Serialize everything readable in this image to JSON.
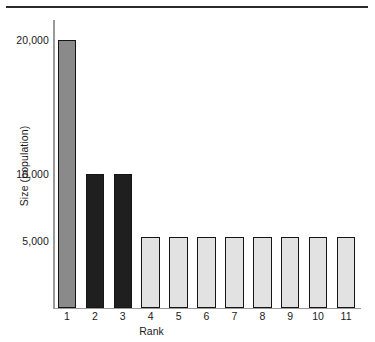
{
  "chart_data": {
    "type": "bar",
    "title": "",
    "subtitle": "",
    "xlabel": "Rank",
    "ylabel": "Size (population)",
    "categories": [
      "1",
      "2",
      "3",
      "4",
      "5",
      "6",
      "7",
      "8",
      "9",
      "10",
      "11"
    ],
    "values": [
      20000,
      10000,
      10000,
      5300,
      5300,
      5300,
      5300,
      5300,
      5300,
      5300,
      5300
    ],
    "series": [
      {
        "name": "Size (population)",
        "values": [
          20000,
          10000,
          10000,
          5300,
          5300,
          5300,
          5300,
          5300,
          5300,
          5300,
          5300
        ]
      }
    ],
    "bar_colors": [
      "#8a8a8a",
      "#1f1f1f",
      "#1f1f1f",
      "#e2e2e2",
      "#e2e2e2",
      "#e2e2e2",
      "#e2e2e2",
      "#e2e2e2",
      "#e2e2e2",
      "#e2e2e2",
      "#e2e2e2"
    ],
    "bar_edge_color": "#151515",
    "ylim": [
      0,
      21500
    ],
    "xlim": [
      0.5,
      11.5
    ],
    "ytick_labels": [
      "20,000",
      "10,000",
      "5,000"
    ],
    "ytick_values": [
      20000,
      10000,
      5000
    ],
    "xtick_labels": [
      "1",
      "2",
      "3",
      "4",
      "5",
      "6",
      "7",
      "8",
      "9",
      "10",
      "11"
    ],
    "grid": false,
    "legend": null,
    "legend_position": "none",
    "axis_color": "#9a9a9a",
    "background": "#ffffff",
    "annotations": []
  },
  "decor": {
    "top_rule_color": "#2b2b2b"
  }
}
